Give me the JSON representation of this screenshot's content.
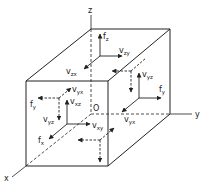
{
  "diagram": {
    "title": "",
    "axes": {
      "x": "x",
      "y": "y",
      "z": "z",
      "origin": "O"
    },
    "colors": {
      "line": "#222222",
      "background": "#ffffff"
    },
    "labels": {
      "fz": {
        "base": "f",
        "sub": "z"
      },
      "vzy": {
        "base": "v",
        "sub": "zy"
      },
      "vzx": {
        "base": "v",
        "sub": "zx"
      },
      "vyz_right": {
        "base": "v",
        "sub": "yz"
      },
      "fy_right": {
        "base": "f",
        "sub": "y"
      },
      "vyx_right": {
        "base": "v",
        "sub": "yx"
      },
      "vyx_front": {
        "base": "v",
        "sub": "yx"
      },
      "fy_left": {
        "base": "f",
        "sub": "y"
      },
      "vxz": {
        "base": "v",
        "sub": "xz"
      },
      "vyz_left": {
        "base": "v",
        "sub": "yz"
      },
      "vxy": {
        "base": "v",
        "sub": "xy"
      },
      "fx": {
        "base": "f",
        "sub": "x"
      }
    }
  }
}
